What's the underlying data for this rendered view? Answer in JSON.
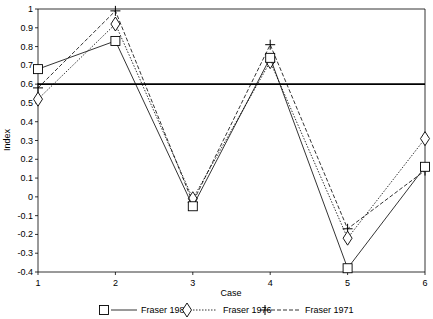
{
  "chart_data": {
    "type": "line",
    "title": "",
    "xlabel": "Case",
    "ylabel": "Index",
    "categories": [
      "1",
      "2",
      "3",
      "4",
      "5",
      "6"
    ],
    "x": [
      1,
      2,
      3,
      4,
      5,
      6
    ],
    "xlim": [
      1,
      6
    ],
    "ylim": [
      -0.4,
      1
    ],
    "yticks": [
      -0.4,
      -0.3,
      -0.2,
      -0.1,
      0,
      0.1,
      0.2,
      0.3,
      0.4,
      0.5,
      0.6,
      0.7,
      0.8,
      0.9,
      1
    ],
    "ytick_labels": [
      "-0.4",
      "-0.3",
      "-0.2",
      "-0.1",
      "0",
      "0.1",
      "0.2",
      "0.3",
      "0.4",
      "0.5",
      "0.6",
      "0.7",
      "0.8",
      "0.9",
      "1"
    ],
    "grid": false,
    "reference_line": {
      "y": 0.6,
      "style": "solid",
      "color": "#000000"
    },
    "legend_position": "bottom",
    "series": [
      {
        "name": "Fraser 1981",
        "marker": "square",
        "line": "solid",
        "values": [
          0.68,
          0.83,
          -0.05,
          0.74,
          -0.38,
          0.16
        ]
      },
      {
        "name": "Fraser 1976",
        "marker": "diamond",
        "line": "dotted",
        "values": [
          0.52,
          0.92,
          -0.01,
          0.72,
          -0.22,
          0.31
        ]
      },
      {
        "name": "Fraser 1971",
        "marker": "plus",
        "line": "dashed",
        "values": [
          0.58,
          0.99,
          -0.03,
          0.81,
          -0.17,
          0.14
        ]
      }
    ]
  },
  "axes": {
    "x_label": "Case",
    "y_label": "Index"
  },
  "legend": {
    "items": [
      {
        "label": "Fraser 1981"
      },
      {
        "label": "Fraser 1976"
      },
      {
        "label": "Fraser 1971"
      }
    ]
  }
}
